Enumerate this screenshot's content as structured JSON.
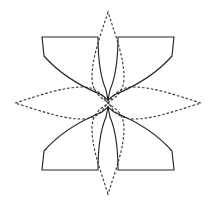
{
  "figure": {
    "title": "Eight-petal rosette geometric construction",
    "type": "line-drawing",
    "width": 216,
    "height": 208,
    "background_color": "#ffffff",
    "stroke_color_solid": "#262626",
    "stroke_color_dashed": "#3a3a3a",
    "stroke_width": 1.15,
    "dash_pattern": "2.6 1.9"
  },
  "geometry": {
    "center": {
      "x": 108,
      "y": 103
    },
    "center_void_radius": 11,
    "petal_count": 8,
    "dashed_petal_count": 4,
    "solid_petal_count": 4,
    "outer_tips": {
      "top": {
        "x": 108,
        "y": 10
      },
      "bottom": {
        "x": 108,
        "y": 196
      },
      "left": {
        "x": 13,
        "y": 103
      },
      "right": {
        "x": 203,
        "y": 103
      }
    },
    "solid_corners": {
      "top_left": {
        "x": 42,
        "y": 37
      },
      "top_right": {
        "x": 174,
        "y": 37
      },
      "bottom_left": {
        "x": 42,
        "y": 170
      },
      "bottom_right": {
        "x": 174,
        "y": 170
      }
    }
  },
  "petals": [
    {
      "id": "petal-north",
      "label": "North petal",
      "style": "dashed",
      "orientation": "up",
      "angle_deg": 270,
      "path": "M 108 12 C 99 40 92 58 92 78 C 92 90 99 97 106 101 L 108 103 L 110 101 C 117 97 124 90 124 78 C 124 58 117 40 108 12 Z"
    },
    {
      "id": "petal-northeast",
      "label": "Northeast petal",
      "style": "solid",
      "orientation": "up-right",
      "angle_deg": 315,
      "path": "M 174 37 L 118 37 C 118 58 116 76 110 90 L 108 100 L 114 95 C 136 86 158 72 172 56 L 174 37 Z"
    },
    {
      "id": "petal-east",
      "label": "East petal",
      "style": "dashed",
      "orientation": "right",
      "angle_deg": 0,
      "path": "M 201 103 C 172 94 153 87 133 87 C 121 87 114 94 110 101 L 108 103 L 110 105 C 114 112 121 119 133 119 C 153 119 172 112 201 103 Z"
    },
    {
      "id": "petal-southeast",
      "label": "Southeast petal",
      "style": "solid",
      "orientation": "down-right",
      "angle_deg": 45,
      "path": "M 174 170 L 118 170 C 118 149 116 131 110 117 L 108 107 L 114 112 C 136 121 158 135 172 151 L 174 170 Z"
    },
    {
      "id": "petal-south",
      "label": "South petal",
      "style": "dashed",
      "orientation": "down",
      "angle_deg": 90,
      "path": "M 108 194 C 99 166 92 148 92 128 C 92 116 99 109 106 105 L 108 103 L 110 105 C 117 109 124 116 124 128 C 124 148 117 166 108 194 Z"
    },
    {
      "id": "petal-southwest",
      "label": "Southwest petal",
      "style": "solid",
      "orientation": "down-left",
      "angle_deg": 135,
      "path": "M 42 170 L 98 170 C 98 149 100 131 106 117 L 108 107 L 102 112 C 80 121 58 135 44 151 L 42 170 Z"
    },
    {
      "id": "petal-west",
      "label": "West petal",
      "style": "dashed",
      "orientation": "left",
      "angle_deg": 180,
      "path": "M 15 103 C 44 94 63 87 83 87 C 95 87 102 94 106 101 L 108 103 L 106 105 C 102 112 95 119 83 119 C 63 119 44 112 15 103 Z"
    },
    {
      "id": "petal-northwest",
      "label": "Northwest petal",
      "style": "solid",
      "orientation": "up-left",
      "angle_deg": 225,
      "path": "M 42 37 L 98 37 C 98 58 100 76 106 90 L 108 100 L 102 95 C 80 86 58 72 44 56 L 42 37 Z"
    }
  ],
  "center_void": {
    "id": "center-octagon",
    "label": "Central octagonal void",
    "path": "M 98 93 L 118 93 L 125 103 L 118 113 L 98 113 L 91 103 Z"
  }
}
